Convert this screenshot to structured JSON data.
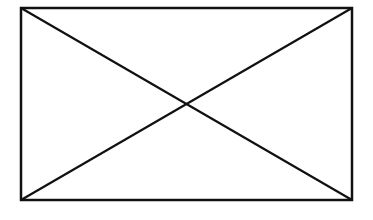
{
  "diagram": {
    "type": "rectangle-with-diagonals",
    "stroke_color": "#111111",
    "background": "#ffffff",
    "rectangle": {
      "x1": 21,
      "y1": 8,
      "x2": 352,
      "y2": 200
    },
    "diagonals": [
      {
        "from": [
          21,
          8
        ],
        "to": [
          352,
          200
        ]
      },
      {
        "from": [
          21,
          200
        ],
        "to": [
          352,
          8
        ]
      }
    ],
    "intersection": [
      186,
      104
    ]
  }
}
